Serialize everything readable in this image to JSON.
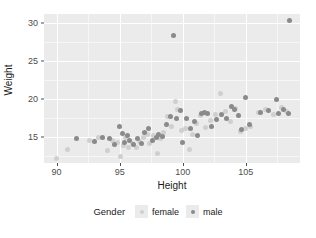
{
  "chart_data": {
    "type": "scatter",
    "title": "",
    "xlabel": "Height",
    "ylabel": "Weight",
    "xlim": [
      89.0,
      109.3
    ],
    "ylim": [
      11.6,
      31.2
    ],
    "xticks": [
      90,
      95,
      100,
      105
    ],
    "yticks": [
      15,
      20,
      25,
      30
    ],
    "xtick_labels": [
      "90",
      "95",
      "100",
      "105"
    ],
    "ytick_labels": [
      "15",
      "20",
      "25",
      "30"
    ],
    "grid": true,
    "grid_major_color": "#ffffff",
    "grid_minor_color": "#f6f6f6",
    "panel_background": "#ebebeb",
    "legend": {
      "position": "bottom",
      "title": "Gender",
      "entries": [
        {
          "label": "female",
          "color": "#cfcfcf"
        },
        {
          "label": "male",
          "color": "#8a8a8a"
        }
      ]
    },
    "series": [
      {
        "name": "female",
        "color": "#cfcfcf",
        "points": [
          [
            90.0,
            12.2
          ],
          [
            90.9,
            13.4
          ],
          [
            92.6,
            14.5
          ],
          [
            93.3,
            14.9
          ],
          [
            94.0,
            13.3
          ],
          [
            94.4,
            14.6
          ],
          [
            94.8,
            14.3
          ],
          [
            95.1,
            12.4
          ],
          [
            95.3,
            13.9
          ],
          [
            95.5,
            15.0
          ],
          [
            95.7,
            13.7
          ],
          [
            96.0,
            14.2
          ],
          [
            96.3,
            13.6
          ],
          [
            96.6,
            14.4
          ],
          [
            96.9,
            14.9
          ],
          [
            97.2,
            15.3
          ],
          [
            97.4,
            14.1
          ],
          [
            97.7,
            15.2
          ],
          [
            98.0,
            12.8
          ],
          [
            98.2,
            14.8
          ],
          [
            98.5,
            15.6
          ],
          [
            98.8,
            17.7
          ],
          [
            99.1,
            16.4
          ],
          [
            99.4,
            19.7
          ],
          [
            99.6,
            18.6
          ],
          [
            99.9,
            15.9
          ],
          [
            100.2,
            16.2
          ],
          [
            100.5,
            13.4
          ],
          [
            100.8,
            15.4
          ],
          [
            101.1,
            16.8
          ],
          [
            101.4,
            17.9
          ],
          [
            101.8,
            16.3
          ],
          [
            102.2,
            17.2
          ],
          [
            102.6,
            18.0
          ],
          [
            103.0,
            20.8
          ],
          [
            103.4,
            18.4
          ],
          [
            103.8,
            17.0
          ],
          [
            104.2,
            18.8
          ],
          [
            104.6,
            15.8
          ],
          [
            105.0,
            16.2
          ],
          [
            105.4,
            16.4
          ],
          [
            106.0,
            18.2
          ],
          [
            106.6,
            18.7
          ],
          [
            107.2,
            18.0
          ],
          [
            107.8,
            18.9
          ],
          [
            108.2,
            18.4
          ]
        ]
      },
      {
        "name": "male",
        "color": "#8a8a8a",
        "points": [
          [
            91.6,
            14.8
          ],
          [
            93.0,
            14.4
          ],
          [
            93.6,
            14.9
          ],
          [
            94.2,
            14.8
          ],
          [
            94.6,
            14.0
          ],
          [
            95.0,
            16.4
          ],
          [
            95.2,
            15.5
          ],
          [
            95.4,
            14.3
          ],
          [
            95.6,
            15.2
          ],
          [
            95.8,
            14.6
          ],
          [
            96.1,
            14.0
          ],
          [
            96.4,
            14.8
          ],
          [
            96.7,
            14.2
          ],
          [
            97.0,
            15.6
          ],
          [
            97.3,
            16.1
          ],
          [
            97.6,
            14.6
          ],
          [
            97.9,
            14.9
          ],
          [
            98.1,
            15.3
          ],
          [
            98.4,
            15.1
          ],
          [
            98.7,
            16.6
          ],
          [
            99.0,
            17.7
          ],
          [
            99.3,
            28.4
          ],
          [
            99.5,
            17.5
          ],
          [
            99.8,
            18.5
          ],
          [
            100.0,
            14.3
          ],
          [
            100.3,
            17.4
          ],
          [
            100.6,
            16.1
          ],
          [
            100.9,
            17.0
          ],
          [
            101.2,
            15.2
          ],
          [
            101.5,
            18.1
          ],
          [
            101.7,
            18.2
          ],
          [
            102.0,
            18.1
          ],
          [
            102.3,
            16.4
          ],
          [
            102.7,
            17.3
          ],
          [
            103.1,
            18.0
          ],
          [
            103.5,
            17.5
          ],
          [
            103.9,
            19.0
          ],
          [
            104.1,
            18.6
          ],
          [
            104.4,
            17.8
          ],
          [
            104.7,
            16.0
          ],
          [
            105.0,
            20.2
          ],
          [
            105.3,
            16.6
          ],
          [
            106.2,
            18.2
          ],
          [
            106.8,
            18.5
          ],
          [
            107.4,
            20.0
          ],
          [
            107.6,
            18.1
          ],
          [
            108.0,
            18.6
          ],
          [
            108.4,
            18.1
          ],
          [
            108.5,
            30.4
          ]
        ]
      }
    ]
  }
}
